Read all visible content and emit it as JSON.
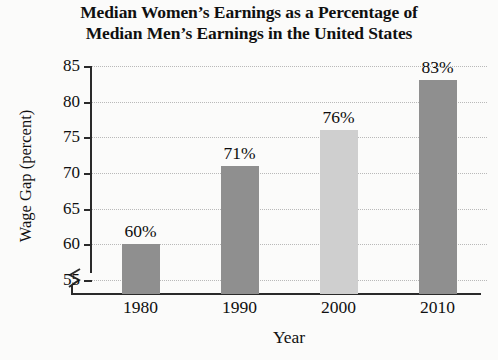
{
  "chart_data": {
    "type": "bar",
    "title_line1": "Median Women’s Earnings as a Percentage of",
    "title_line2": "Median Men’s Earnings in the United States",
    "xlabel": "Year",
    "ylabel": "Wage Gap (percent)",
    "categories": [
      "1980",
      "1990",
      "2000",
      "2010"
    ],
    "values": [
      60,
      71,
      76,
      83
    ],
    "value_labels": [
      "60%",
      "71%",
      "76%",
      "83%"
    ],
    "ylim": [
      53,
      85
    ],
    "yticks": [
      55,
      60,
      65,
      70,
      75,
      80,
      85
    ],
    "ytick_labels": [
      "55",
      "60",
      "65",
      "70",
      "75",
      "80",
      "85"
    ],
    "grid": true,
    "grid_axis": "y",
    "grid_style": "dotted",
    "legend": "none",
    "axis_break": true,
    "axis_break_note": "zigzag break on y-axis below 55",
    "bar_colors": [
      "#8f8f8f",
      "#8f8f8f",
      "#cfcfcf",
      "#8f8f8f"
    ],
    "colors": {
      "background": "#fbfbfa",
      "axis": "#2a2a2a",
      "grid": "#b9b9b9",
      "text": "#101010",
      "bar_dark": "#8f8f8f",
      "bar_light": "#cfcfcf"
    }
  }
}
